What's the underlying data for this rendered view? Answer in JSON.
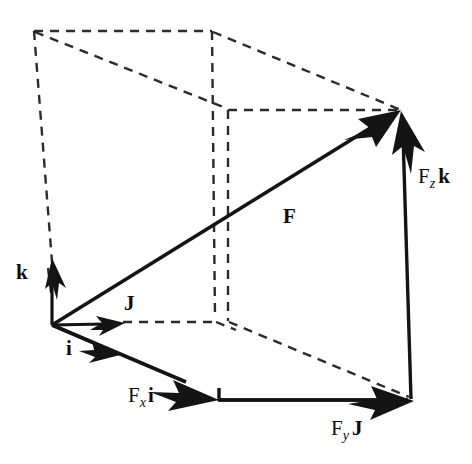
{
  "figure": {
    "type": "3d-vector-decomposition-diagram",
    "background_color": "#ffffff",
    "line_color": "#141414",
    "dash_color": "#2b2b2b",
    "labels": {
      "resultant": "F",
      "unit_x": "i",
      "unit_y": "J",
      "unit_z": "k",
      "component_x_prefix": "F",
      "component_x_sub": "x",
      "component_x_basis": "i",
      "component_y_prefix": "F",
      "component_y_sub": "y",
      "component_y_basis": "J",
      "component_z_prefix": "F",
      "component_z_sub": "z",
      "component_z_basis": "k"
    },
    "geometry": {
      "origin": [
        52,
        325
      ],
      "vector_tip": [
        400,
        110
      ],
      "x_component_tip": [
        218,
        400
      ],
      "y_component_tip": [
        412,
        401
      ],
      "z_component_tip": [
        401,
        112
      ],
      "box_corners": {
        "back_top_left": [
          34,
          31
        ],
        "back_top_right": [
          212,
          31
        ],
        "front_top_right": [
          401,
          110
        ],
        "front_top_left": [
          228,
          110
        ],
        "back_bottom_left": [
          52,
          325
        ],
        "back_bottom_right": [
          218,
          325
        ],
        "front_bottom_left": [
          228,
          322
        ],
        "front_bottom_right": [
          412,
          401
        ]
      }
    }
  }
}
